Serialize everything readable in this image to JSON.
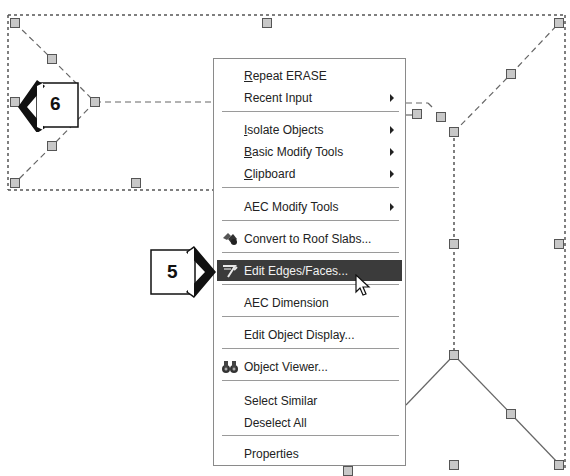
{
  "context_menu": {
    "items": [
      {
        "label_pre": "",
        "label_ul": "R",
        "label_post": "epeat ERASE",
        "submenu": false
      },
      {
        "label_pre": "Recent Input",
        "label_ul": "",
        "label_post": "",
        "submenu": true
      },
      {
        "label_pre": "",
        "label_ul": "I",
        "label_post": "solate Objects",
        "submenu": true
      },
      {
        "label_pre": "",
        "label_ul": "B",
        "label_post": "asic Modify Tools",
        "submenu": true
      },
      {
        "label_pre": "",
        "label_ul": "C",
        "label_post": "lipboard",
        "submenu": true
      },
      {
        "label_pre": "AEC Modify Tools",
        "label_ul": "",
        "label_post": "",
        "submenu": true
      },
      {
        "label_pre": "Convert to Roof Slabs...",
        "label_ul": "",
        "label_post": "",
        "icon": "roof-slab-icon"
      },
      {
        "label_pre": "Edit Edges/Faces...",
        "label_ul": "",
        "label_post": "",
        "icon": "edit-edges-icon",
        "highlighted": true
      },
      {
        "label_pre": "AEC Dimension",
        "label_ul": "",
        "label_post": ""
      },
      {
        "label_pre": "Edit Object Display...",
        "label_ul": "",
        "label_post": ""
      },
      {
        "label_pre": "Object Viewer...",
        "label_ul": "",
        "label_post": "",
        "icon": "binoculars-icon"
      },
      {
        "label_pre": "Select Similar",
        "label_ul": "",
        "label_post": ""
      },
      {
        "label_pre": "Deselect All",
        "label_ul": "",
        "label_post": ""
      },
      {
        "label_pre": "Properties",
        "label_ul": "",
        "label_post": ""
      }
    ]
  },
  "callouts": {
    "step5": "5",
    "step6": "6"
  },
  "colors": {
    "highlight_bg": "#3b3b3b",
    "grip_fill": "#c8c8c8",
    "menu_border": "#8a8a8a"
  }
}
